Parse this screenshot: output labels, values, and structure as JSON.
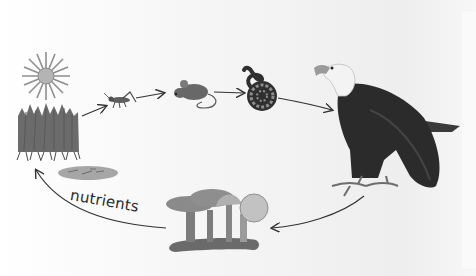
{
  "diagram": {
    "type": "food-chain-cycle",
    "colors": {
      "background": "#f2f2f2",
      "ink": "#333333",
      "eagle_body": "#2b2b2b",
      "eagle_head": "#f5f5f5",
      "grass": "#6a6a6a",
      "mushroom": "#8a8a8a",
      "sun": "#9a9a9a"
    },
    "nodes": [
      {
        "id": "sun",
        "label": "Sun",
        "role": "energy source"
      },
      {
        "id": "grass",
        "label": "Grass",
        "role": "producer"
      },
      {
        "id": "grasshopper",
        "label": "Grasshopper",
        "role": "primary consumer"
      },
      {
        "id": "mouse",
        "label": "Mouse",
        "role": "secondary consumer"
      },
      {
        "id": "snake",
        "label": "Snake",
        "role": "tertiary consumer"
      },
      {
        "id": "eagle",
        "label": "Eagle",
        "role": "top predator"
      },
      {
        "id": "mushrooms",
        "label": "Mushrooms",
        "role": "decomposer"
      },
      {
        "id": "soil",
        "label": "Soil",
        "role": "nutrient pool"
      }
    ],
    "edges": [
      {
        "from": "grass",
        "to": "grasshopper"
      },
      {
        "from": "grasshopper",
        "to": "mouse"
      },
      {
        "from": "mouse",
        "to": "snake"
      },
      {
        "from": "snake",
        "to": "eagle"
      },
      {
        "from": "eagle",
        "to": "mushrooms"
      },
      {
        "from": "mushrooms",
        "to": "grass",
        "label": "nutrients"
      }
    ],
    "labels": {
      "nutrients": "nutrients"
    }
  }
}
